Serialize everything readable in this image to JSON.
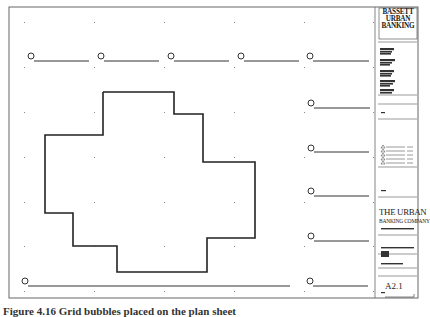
{
  "sheet": {
    "type": "architectural-plan-sheet",
    "line_color": "#333333",
    "grid_marker_color": "#777777"
  },
  "title_block": {
    "firm_header": [
      "BASSETT",
      "URBAN",
      "BANKING"
    ],
    "firm_header_subtitle": "ASSOCIATES",
    "consultant_blocks": [
      "ARCHITECT",
      "STRUCTURAL",
      "MECHANICAL",
      "ELECTRICAL",
      "CIVIL"
    ],
    "revision_label": "REV",
    "revisions_count": 6,
    "project_label": "PROJECT",
    "company_line1": "THE URBAN",
    "company_line2": "BANKING COMPANY",
    "company_address": "123 MAIN STREET, ANYTOWN",
    "drawing_title": "DRAWING SET TITLE",
    "drawing_subtitle": "DRAWING DESCRIPTION",
    "level_label": "LEVEL 1 FLOOR PLAN",
    "sheet_number": "A2.1",
    "scale_label": "SCALE"
  },
  "grid_bubbles": {
    "top": [
      "",
      "",
      "",
      "",
      ""
    ],
    "right": [
      "",
      "",
      "",
      "",
      ""
    ],
    "bottom_left": ""
  },
  "caption": {
    "text": "Figure 4.16 Grid bubbles placed on the plan sheet"
  }
}
